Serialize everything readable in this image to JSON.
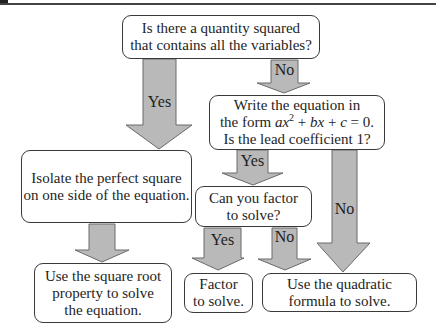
{
  "diagram": {
    "type": "flowchart",
    "nodes": {
      "q1": {
        "line1": "Is there a quantity squared",
        "line2": "that contains all the variables?"
      },
      "q2": {
        "line1": "Write the equation in",
        "line2_prefix": "the form ",
        "line2_a": "ax",
        "line2_exp": "2",
        "line2_mid": " + ",
        "line2_b": "bx",
        "line2_plus": " + ",
        "line2_c": "c",
        "line2_suffix": " = 0.",
        "line3": "Is the lead coefficient 1?"
      },
      "isolate": {
        "line1": "Isolate the perfect square",
        "line2": "on one side of the equation."
      },
      "q3": {
        "line1": "Can you factor",
        "line2": "to solve?"
      },
      "sqrt_root": {
        "line1": "Use the square root",
        "line2": "property to solve",
        "line3": "the equation."
      },
      "factor": {
        "line1": "Factor",
        "line2": "to solve."
      },
      "quadratic": {
        "line1": "Use the quadratic",
        "line2": "formula to solve."
      }
    },
    "edges": [
      {
        "from": "q1",
        "to": "isolate",
        "label": "Yes"
      },
      {
        "from": "q1",
        "to": "q2",
        "label": "No"
      },
      {
        "from": "q2",
        "to": "q3",
        "label": "Yes"
      },
      {
        "from": "q2",
        "to": "quadratic",
        "label": "No"
      },
      {
        "from": "isolate",
        "to": "sqrt_root",
        "label": ""
      },
      {
        "from": "q3",
        "to": "factor",
        "label": "Yes"
      },
      {
        "from": "q3",
        "to": "quadratic",
        "label": "No"
      }
    ],
    "colors": {
      "arrow_fill": "#b9b9b9",
      "arrow_stroke": "#6a6a6a",
      "box_border": "#3a3a3a",
      "text": "#1e1e1e",
      "rule": "#444444"
    }
  }
}
